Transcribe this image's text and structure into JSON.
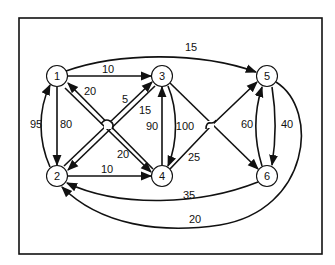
{
  "diagram": {
    "type": "directed-weighted-graph",
    "nodes": [
      {
        "id": "1",
        "label": "1",
        "x": 57,
        "y": 76
      },
      {
        "id": "2",
        "label": "2",
        "x": 57,
        "y": 176
      },
      {
        "id": "3",
        "label": "3",
        "x": 162,
        "y": 76
      },
      {
        "id": "4",
        "label": "4",
        "x": 162,
        "y": 176
      },
      {
        "id": "5",
        "label": "5",
        "x": 267,
        "y": 76
      },
      {
        "id": "6",
        "label": "6",
        "x": 267,
        "y": 176
      }
    ],
    "edges": [
      {
        "from": "1",
        "to": "3",
        "weight": "10"
      },
      {
        "from": "1",
        "to": "5",
        "weight": "15"
      },
      {
        "from": "1",
        "to": "2",
        "weight": "80"
      },
      {
        "from": "2",
        "to": "1",
        "weight": "95"
      },
      {
        "from": "4",
        "to": "1",
        "weight": "20"
      },
      {
        "from": "1",
        "to": "4",
        "weight": "20"
      },
      {
        "from": "2",
        "to": "3",
        "weight": "5"
      },
      {
        "from": "3",
        "to": "2",
        "weight": "15"
      },
      {
        "from": "2",
        "to": "4",
        "weight": "10"
      },
      {
        "from": "4",
        "to": "3",
        "weight": "90"
      },
      {
        "from": "3",
        "to": "4",
        "weight": "100"
      },
      {
        "from": "4",
        "to": "5",
        "weight": "25"
      },
      {
        "from": "3",
        "to": "6",
        "weight": ""
      },
      {
        "from": "6",
        "to": "5",
        "weight": "60"
      },
      {
        "from": "5",
        "to": "6",
        "weight": "40"
      },
      {
        "from": "6",
        "to": "2",
        "weight": "35"
      },
      {
        "from": "5",
        "to": "2",
        "weight": "20"
      }
    ]
  },
  "labels": {
    "n1": "1",
    "n2": "2",
    "n3": "3",
    "n4": "4",
    "n5": "5",
    "n6": "6",
    "e13": "10",
    "e15": "15",
    "e12": "80",
    "e21": "95",
    "e41": "20",
    "e14": "20",
    "e23": "5",
    "e32": "15",
    "e24": "10",
    "e43": "90",
    "e34": "100",
    "e45": "25",
    "e65": "60",
    "e56": "40",
    "e62": "35",
    "e52": "20"
  },
  "colors": {
    "stroke": "#111111",
    "background": "#ffffff"
  }
}
